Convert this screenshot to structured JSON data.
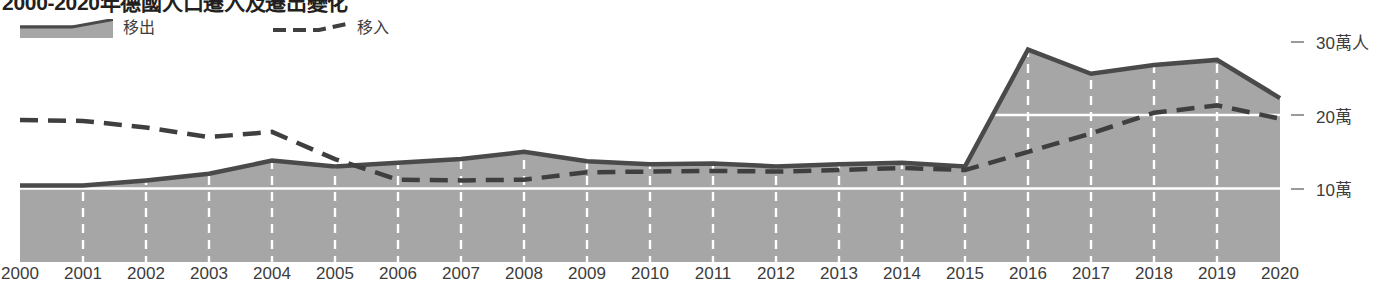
{
  "title": "2000-2020年德國人口遷入及遷出變化",
  "legend": {
    "emigration": {
      "label": "移出",
      "swatch": "area-swatch",
      "color": "#a6a6a6",
      "line_color": "#4a4a4a"
    },
    "immigration": {
      "label": "移入",
      "swatch": "dashed-line-swatch",
      "color": "#3f3f3f"
    }
  },
  "axis": {
    "y_unit_top": "30萬人",
    "y_ticks": [
      "30萬人",
      "20萬",
      "10萬"
    ],
    "y_tick_values": [
      30,
      20,
      10
    ],
    "x_ticks": [
      "2000",
      "2001",
      "2002",
      "2003",
      "2004",
      "2005",
      "2006",
      "2007",
      "2008",
      "2009",
      "2010",
      "2011",
      "2012",
      "2013",
      "2014",
      "2015",
      "2016",
      "2017",
      "2018",
      "2019",
      "2020"
    ]
  },
  "chart_data": {
    "type": "area",
    "title": "2000-2020年德國人口遷入及遷出變化",
    "xlabel": "",
    "ylabel": "萬人",
    "ylim": [
      0,
      32
    ],
    "grid": true,
    "legend_position": "top-left",
    "categories": [
      "2000",
      "2001",
      "2002",
      "2003",
      "2004",
      "2005",
      "2006",
      "2007",
      "2008",
      "2009",
      "2010",
      "2011",
      "2012",
      "2013",
      "2014",
      "2015",
      "2016",
      "2017",
      "2018",
      "2019",
      "2020"
    ],
    "series": [
      {
        "name": "移出",
        "style": "filled-area-with-solid-line",
        "fill_color": "#a6a6a6",
        "line_color": "#4a4a4a",
        "values": [
          10.4,
          10.4,
          11.1,
          12.0,
          13.8,
          13.0,
          13.5,
          14.0,
          15.0,
          13.7,
          13.3,
          13.4,
          13.0,
          13.3,
          13.5,
          13.0,
          28.9,
          25.6,
          26.8,
          27.5,
          22.3
        ]
      },
      {
        "name": "移入",
        "style": "dashed-line",
        "line_color": "#3f3f3f",
        "values": [
          19.3,
          19.2,
          18.3,
          17.0,
          17.7,
          14.0,
          11.2,
          11.1,
          11.2,
          12.2,
          12.3,
          12.4,
          12.3,
          12.5,
          12.8,
          12.5,
          15.0,
          17.5,
          20.3,
          21.3,
          19.5
        ]
      }
    ],
    "gridlines_y": [
      10,
      20
    ],
    "gridlines_x": [
      "2001",
      "2002",
      "2003",
      "2004",
      "2005",
      "2006",
      "2007",
      "2008",
      "2009",
      "2010",
      "2011",
      "2012",
      "2013",
      "2014",
      "2015",
      "2016",
      "2017",
      "2018",
      "2019"
    ]
  }
}
